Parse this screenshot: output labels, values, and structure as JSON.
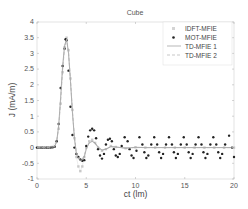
{
  "chart_data": {
    "type": "line",
    "title": "Cube",
    "xlabel": "ct (lm)",
    "ylabel": "J (mA/m)",
    "xlim": [
      0,
      20
    ],
    "ylim": [
      -1,
      4
    ],
    "xticks": [
      0,
      5,
      10,
      15,
      20
    ],
    "xtick_labels": [
      "0",
      "5",
      "10",
      "15",
      "20"
    ],
    "yticks": [
      -1,
      -0.5,
      0,
      0.5,
      1,
      1.5,
      2,
      2.5,
      3,
      3.5,
      4
    ],
    "ytick_labels": [
      "-1",
      "-0.5",
      "0",
      "0.5",
      "1",
      "1.5",
      "2",
      "2.5",
      "3",
      "3.5",
      "4"
    ],
    "grid": false,
    "legend_position": "upper right",
    "series": [
      {
        "name": "IDFT-MFIE",
        "style": "light-square-markers",
        "color": "#c8c8c8",
        "x": [
          0,
          0.5,
          1,
          1.5,
          2,
          2.2,
          2.4,
          2.6,
          2.8,
          3.0,
          3.2,
          3.4,
          3.6,
          3.8,
          4.0,
          4.2,
          4.4,
          4.6,
          4.8,
          5.0,
          5.3,
          5.6,
          5.9,
          6.2,
          6.6,
          7.0,
          7.5,
          8.0,
          9,
          10,
          11,
          12,
          13,
          14,
          15,
          16,
          17,
          18,
          19,
          20
        ],
        "y": [
          0,
          0,
          0,
          0.02,
          0.2,
          0.6,
          1.4,
          2.4,
          3.2,
          3.5,
          3.1,
          2.2,
          1.2,
          0.3,
          -0.3,
          -0.6,
          -0.75,
          -0.6,
          -0.3,
          0.0,
          0.2,
          0.25,
          0.15,
          0.0,
          -0.1,
          -0.05,
          0.05,
          0.02,
          -0.02,
          0.01,
          0,
          0,
          0,
          0,
          0,
          0,
          0,
          0,
          0,
          0
        ]
      },
      {
        "name": "MOT-MFIE",
        "style": "black-dot-markers",
        "color": "#222222",
        "x": [
          0,
          0.2,
          0.4,
          0.6,
          0.8,
          1.0,
          1.2,
          1.4,
          1.6,
          1.8,
          2.0,
          2.2,
          2.4,
          2.6,
          2.8,
          2.9,
          3.0,
          3.2,
          3.4,
          3.6,
          3.8,
          4.0,
          4.2,
          4.4,
          4.6,
          4.8,
          5.0,
          5.2,
          5.4,
          5.6,
          5.8,
          6.0,
          6.2,
          6.4,
          6.6,
          6.8,
          7.0,
          7.2,
          7.4,
          7.6,
          7.8,
          8.0,
          8.2,
          8.4,
          8.6,
          8.9,
          9.2,
          9.4,
          9.6,
          9.8,
          10.1,
          10.4,
          10.7,
          10.9,
          11.1,
          11.3,
          11.6,
          11.9,
          12.2,
          12.4,
          12.6,
          12.8,
          13.1,
          13.4,
          13.7,
          13.9,
          14.1,
          14.3,
          14.6,
          14.9,
          15.2,
          15.4,
          15.6,
          15.8,
          16.1,
          16.4,
          16.7,
          16.9,
          17.1,
          17.3,
          17.6,
          17.9,
          18.2,
          18.4,
          18.6,
          18.8,
          19.1,
          19.5,
          19.8,
          20.0
        ],
        "y": [
          0,
          0,
          0,
          0,
          0,
          0,
          0,
          0,
          0.01,
          0.03,
          0.2,
          0.75,
          1.9,
          2.6,
          3.15,
          3.45,
          3.42,
          2.45,
          1.3,
          0.4,
          0.0,
          -0.2,
          -0.3,
          -0.38,
          -0.42,
          -0.4,
          0.05,
          0.35,
          0.55,
          0.6,
          0.55,
          0.3,
          -0.05,
          -0.25,
          -0.35,
          -0.2,
          0.1,
          0.25,
          0.28,
          0.2,
          -0.05,
          -0.25,
          -0.3,
          -0.2,
          0.05,
          0.33,
          0.2,
          -0.05,
          -0.25,
          -0.33,
          -0.1,
          0.33,
          0.1,
          -0.15,
          -0.33,
          -0.25,
          0.1,
          0.33,
          0.1,
          -0.15,
          -0.33,
          -0.2,
          0.1,
          0.33,
          0.1,
          -0.15,
          -0.33,
          -0.2,
          0.1,
          0.33,
          0.1,
          -0.15,
          -0.33,
          -0.2,
          0.1,
          0.33,
          0.1,
          -0.15,
          -0.33,
          -0.2,
          0.1,
          0.33,
          0.1,
          -0.15,
          -0.33,
          -0.2,
          0.1,
          0.38,
          0.0,
          -0.3
        ]
      },
      {
        "name": "TD-MFIE 1",
        "style": "solid-line",
        "color": "#9a9a9a",
        "x": [
          0,
          1,
          1.8,
          2.0,
          2.2,
          2.4,
          2.6,
          2.8,
          3.0,
          3.2,
          3.4,
          3.6,
          3.8,
          4.0,
          4.2,
          4.4,
          4.6,
          4.8,
          5.0,
          5.3,
          5.6,
          5.9,
          6.2,
          6.6,
          7.0,
          7.5,
          8.0,
          9,
          10,
          11,
          12,
          13,
          14,
          15,
          16,
          17,
          18,
          19,
          20
        ],
        "y": [
          0,
          0,
          0.03,
          0.2,
          0.7,
          1.6,
          2.6,
          3.25,
          3.45,
          3.0,
          2.1,
          1.1,
          0.3,
          -0.2,
          -0.35,
          -0.42,
          -0.4,
          -0.3,
          -0.05,
          0.15,
          0.2,
          0.15,
          0.02,
          -0.08,
          -0.05,
          0.03,
          0.02,
          -0.02,
          0.01,
          0,
          0,
          0,
          0,
          0,
          0,
          0,
          0,
          0,
          0
        ]
      },
      {
        "name": "TD-MFIE 2",
        "style": "dashed-line",
        "color": "#b0b0b0",
        "x": [
          0,
          1,
          1.8,
          2.0,
          2.2,
          2.4,
          2.6,
          2.8,
          3.0,
          3.2,
          3.4,
          3.6,
          3.8,
          4.0,
          4.2,
          4.4,
          4.6,
          4.8,
          5.0,
          5.3,
          5.6,
          5.9,
          6.2,
          6.6,
          7.0,
          7.5,
          8.0,
          9,
          10,
          11,
          12,
          13,
          14,
          15,
          16,
          17,
          18,
          19,
          20
        ],
        "y": [
          0,
          0,
          0.03,
          0.2,
          0.65,
          1.5,
          2.5,
          3.2,
          3.45,
          3.05,
          2.15,
          1.15,
          0.35,
          -0.15,
          -0.3,
          -0.38,
          -0.36,
          -0.25,
          -0.02,
          0.15,
          0.2,
          0.12,
          0.0,
          -0.08,
          -0.04,
          0.03,
          0.01,
          -0.01,
          0,
          0,
          0,
          0,
          0,
          0,
          0,
          0,
          0,
          0,
          0
        ]
      }
    ]
  },
  "legend": {
    "items": [
      {
        "label": "IDFT-MFIE"
      },
      {
        "label": "MOT-MFIE"
      },
      {
        "label": "TD-MFIE 1"
      },
      {
        "label": "TD-MFIE 2"
      }
    ]
  }
}
